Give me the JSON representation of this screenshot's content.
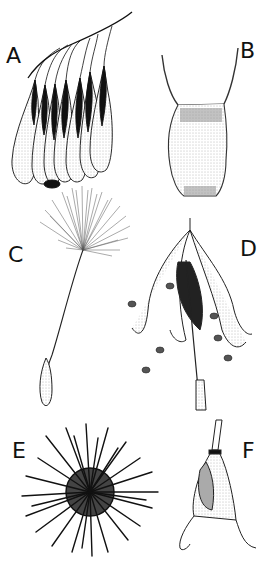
{
  "figure": {
    "panels": [
      {
        "id": "A",
        "label": "A",
        "subject": "cluster of winged seeds hanging from a twig"
      },
      {
        "id": "B",
        "label": "B",
        "subject": "achene with two bristle awns"
      },
      {
        "id": "C",
        "label": "C",
        "subject": "plumed seed with pappus on a long beak"
      },
      {
        "id": "D",
        "label": "D",
        "subject": "dehisced capsule releasing seeds"
      },
      {
        "id": "E",
        "label": "E",
        "subject": "spiny burr with hooked spines"
      },
      {
        "id": "F",
        "label": "F",
        "subject": "horned seed pod with two curved hooks"
      }
    ],
    "colors": {
      "ink": "#111111",
      "paper": "#ffffff",
      "stipple": "#888888"
    }
  }
}
